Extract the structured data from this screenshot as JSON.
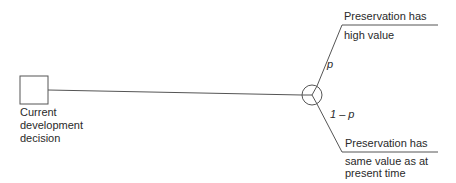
{
  "diagram": {
    "type": "decision-tree",
    "colors": {
      "line": "#555555",
      "text": "#2a2a2a",
      "background": "#ffffff"
    },
    "decision_node": {
      "shape": "square",
      "label_lines": [
        "Current",
        "development",
        "decision"
      ]
    },
    "chance_node": {
      "shape": "circle"
    },
    "branches": [
      {
        "probability": "p",
        "outcome_lines": [
          "Preservation has",
          "high value"
        ]
      },
      {
        "probability": "1 – p",
        "outcome_lines": [
          "Preservation has",
          "same value as at",
          "present time"
        ]
      }
    ]
  }
}
